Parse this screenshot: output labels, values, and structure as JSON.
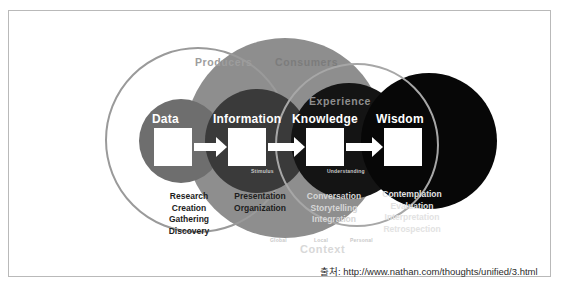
{
  "diagram": {
    "rings": {
      "producers": "Producers",
      "consumers": "Consumers",
      "experience": "Experience",
      "context": "Context"
    },
    "stages": [
      {
        "id": "data",
        "label": "Data",
        "words": [
          "Research",
          "Creation",
          "Gathering",
          "Discovery"
        ],
        "fill": "#6e6e6e"
      },
      {
        "id": "information",
        "label": "Information",
        "words": [
          "Presentation",
          "Organization"
        ],
        "fill": "#3a3a3a"
      },
      {
        "id": "knowledge",
        "label": "Knowledge",
        "words": [
          "Conversation",
          "Storytelling",
          "Integration"
        ],
        "fill": "#141414"
      },
      {
        "id": "wisdom",
        "label": "Wisdom",
        "words": [
          "Contemplation",
          "Evaluation",
          "Interpretation",
          "Retrospection"
        ],
        "fill": "#070707"
      }
    ],
    "transitions": {
      "stimulus": "Stimulus",
      "understanding": "Understanding"
    },
    "context_scale": {
      "global": "Global",
      "local": "Local",
      "personal": "Personal"
    },
    "colors": {
      "consumers_disc": "#8e8e8e",
      "producers_ring": "#9a9a9a",
      "experience_ring": "#a7a7a7",
      "flow": "#ffffff",
      "frame": "#b9b9b9"
    }
  },
  "source": {
    "label_prefix": "출처:",
    "url": "http://www.nathan.com/thoughts/unified/3.html",
    "full": "출처:  http://www.nathan.com/thoughts/unified/3.html"
  }
}
